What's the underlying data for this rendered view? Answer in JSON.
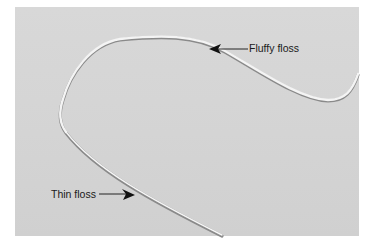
{
  "figure": {
    "background_color": "#d5d5d5",
    "labels": [
      {
        "id": "fluffy",
        "text": "Fluffy floss"
      },
      {
        "id": "thin",
        "text": "Thin floss"
      }
    ]
  }
}
